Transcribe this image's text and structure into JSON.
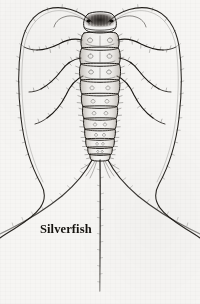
{
  "figure": {
    "caption": "Silverfish",
    "subject": "silverfish",
    "common_name": "Silverfish",
    "view": "dorsal",
    "medium": "pen-and-ink line drawing",
    "background_color": "#f6f5f3",
    "ink_color": "#1a1713",
    "caption_color": "#15130f",
    "canvas": {
      "width": 200,
      "height": 304
    },
    "anatomy": {
      "head_label": "head",
      "antennae_label": "antennae",
      "antennae_count": 2,
      "thorax_label": "thorax",
      "abdomen_label": "abdomen",
      "abdominal_segments": 8,
      "legs_label": "legs",
      "leg_count": 6,
      "leg_pairs": 3,
      "cerci_label": "caudal filaments",
      "cerci_count": 3,
      "eyes_label": "compound eyes",
      "setae_label": "setae"
    }
  }
}
